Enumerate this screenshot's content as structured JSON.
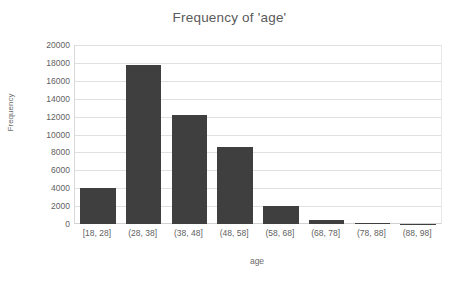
{
  "chart_data": {
    "type": "bar",
    "title": "Frequency of 'age'",
    "xlabel": "age",
    "ylabel": "Frequency",
    "categories": [
      "[18, 28]",
      "(28, 38]",
      "(38, 48]",
      "(48, 58]",
      "(58, 68]",
      "(68, 78]",
      "(78, 88]",
      "(88, 98]"
    ],
    "values": [
      4050,
      17800,
      12200,
      8650,
      2050,
      450,
      150,
      20
    ],
    "ylim": [
      0,
      20000
    ],
    "yticks": [
      0,
      2000,
      4000,
      6000,
      8000,
      10000,
      12000,
      14000,
      16000,
      18000,
      20000
    ],
    "ytick_labels": [
      "0",
      "2000",
      "4000",
      "6000",
      "8000",
      "10000",
      "12000",
      "14000",
      "16000",
      "18000",
      "20000"
    ],
    "grid": true,
    "legend": false,
    "bar_color": "#3f3f3f",
    "gridline_color": "#e0e0e0",
    "background_color": "#ffffff",
    "text_color": "#5f5f5f",
    "title_color": "#5a5a5a"
  }
}
